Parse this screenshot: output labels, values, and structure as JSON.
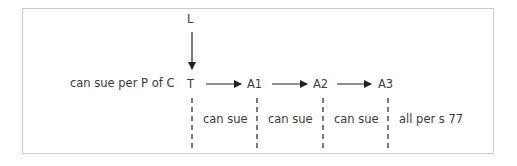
{
  "diagram": {
    "nodes": {
      "L": "L",
      "T": "T",
      "A1": "A1",
      "A2": "A2",
      "A3": "A3"
    },
    "side_note": "can sue per P of C",
    "segments": [
      "can sue",
      "can sue",
      "can sue",
      "all per s 77"
    ],
    "edges": [
      {
        "from": "L",
        "to": "T"
      },
      {
        "from": "T",
        "to": "A1"
      },
      {
        "from": "A1",
        "to": "A2"
      },
      {
        "from": "A2",
        "to": "A3"
      }
    ],
    "colors": {
      "border": "#c9c9c9",
      "line": "#222222",
      "text": "#3a3a3a"
    }
  }
}
